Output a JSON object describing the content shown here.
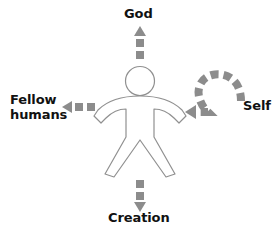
{
  "diagram": {
    "title_text": "",
    "center_figure": {
      "name": "human-figure",
      "description": "outlined stick person"
    },
    "colors": {
      "arrow": "#8c8c8c",
      "figure_outline": "#909090",
      "figure_fill": "#ffffff",
      "text": "#111111",
      "background": "#ffffff"
    },
    "labels": {
      "god": "God",
      "self": "Self",
      "creation": "Creation",
      "fellow_humans_line1": "Fellow",
      "fellow_humans_line2": "humans",
      "fellow_humans": "Fellow humans"
    },
    "arrows": [
      {
        "name": "arrow-up-to-god",
        "from": "human-figure",
        "to": "God",
        "direction": "up",
        "style": "dashed",
        "head": "triangle"
      },
      {
        "name": "arrow-left-to-fellow-humans",
        "from": "human-figure",
        "to": "Fellow humans",
        "direction": "left",
        "style": "dashed",
        "head": "triangle"
      },
      {
        "name": "arrow-down-to-creation",
        "from": "human-figure",
        "to": "Creation",
        "direction": "down",
        "style": "dashed",
        "head": "triangle"
      },
      {
        "name": "arrow-curved-from-self",
        "from": "Self",
        "to": "human-figure",
        "direction": "curved-left",
        "style": "dashed",
        "head": "triangle"
      }
    ]
  }
}
